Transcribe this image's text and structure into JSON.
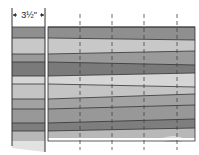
{
  "diagram": {
    "dimension_label": "3½\"",
    "left_strip": {
      "x": 12,
      "width": 33,
      "stripes": [
        {
          "y": 27,
          "h": 11,
          "color": "#8f8f8f"
        },
        {
          "y": 38,
          "h": 16,
          "color": "#c8c8c8"
        },
        {
          "y": 54,
          "h": 8,
          "color": "#9a9a9a"
        },
        {
          "y": 62,
          "h": 14,
          "color": "#7a7a7a"
        },
        {
          "y": 76,
          "h": 8,
          "color": "#d6d6d6"
        },
        {
          "y": 84,
          "h": 15,
          "color": "#c4c4c4"
        },
        {
          "y": 99,
          "h": 10,
          "color": "#a2a2a2"
        },
        {
          "y": 109,
          "h": 14,
          "color": "#989898"
        },
        {
          "y": 123,
          "h": 8,
          "color": "#7e7e7e"
        },
        {
          "y": 131,
          "h": 10,
          "color": "#b8b8b8"
        }
      ]
    },
    "right_panel": {
      "x": 48,
      "width": 147,
      "stripes": [
        {
          "yl": 27,
          "yr": 27,
          "color": "#8f8f8f"
        },
        {
          "yl": 38,
          "yr": 40,
          "color": "#c8c8c8"
        },
        {
          "yl": 54,
          "yr": 51,
          "color": "#9a9a9a"
        },
        {
          "yl": 62,
          "yr": 65,
          "color": "#7a7a7a"
        },
        {
          "yl": 76,
          "yr": 73,
          "color": "#d6d6d6"
        },
        {
          "yl": 84,
          "yr": 87,
          "color": "#c4c4c4"
        },
        {
          "yl": 99,
          "yr": 94,
          "color": "#a2a2a2"
        },
        {
          "yl": 109,
          "yr": 105,
          "color": "#989898"
        },
        {
          "yl": 123,
          "yr": 119,
          "color": "#7e7e7e"
        },
        {
          "yl": 131,
          "yr": 128,
          "color": "#b8b8b8"
        }
      ],
      "bottom": 141
    },
    "dashed_lines_x": [
      80,
      112,
      144,
      177
    ],
    "line_color": "#333333"
  }
}
